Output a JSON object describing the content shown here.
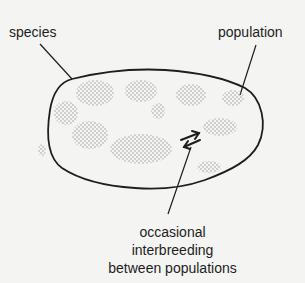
{
  "diagram": {
    "labels": {
      "species": "species",
      "population": "population",
      "interbreeding": [
        "occasional",
        "interbreeding",
        "between populations"
      ]
    },
    "elements": {
      "species_outline": "species-range-outline",
      "populations_count": 11,
      "interbreeding_arrows": "double-arrow-left-right"
    },
    "colors": {
      "background": "#f4f4f2",
      "ink": "#1e1e1e",
      "stipple": "#8a8a8a"
    }
  }
}
